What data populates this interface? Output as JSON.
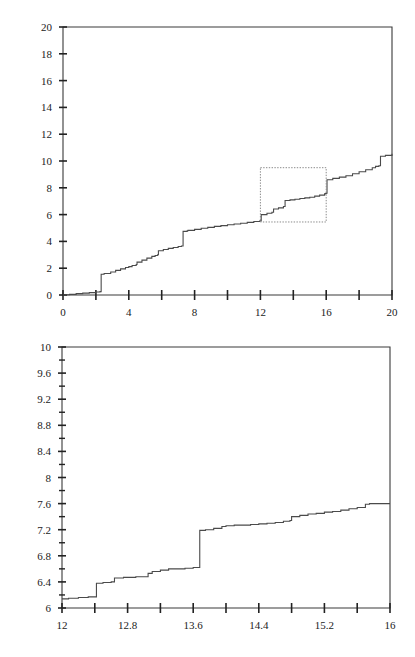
{
  "figure": {
    "title": "",
    "background": "#ffffff",
    "line_color": "#4a4a4a",
    "axis_color": "#3a3a3a",
    "zoom_box_color": "#8a8a8a"
  },
  "chart_data": [
    {
      "type": "line",
      "name": "overview-step-plot",
      "title": "",
      "xlabel": "",
      "ylabel": "",
      "xlim": [
        0,
        20
      ],
      "ylim": [
        0,
        20
      ],
      "grid": false,
      "legend": null,
      "xticks": [
        0,
        2,
        4,
        6,
        8,
        10,
        12,
        14,
        16,
        18,
        20
      ],
      "xtick_labels": [
        "0",
        "",
        "4",
        "",
        "8",
        "",
        "12",
        "",
        "16",
        "",
        "20"
      ],
      "yticks": [
        0,
        2,
        4,
        6,
        8,
        10,
        12,
        14,
        16,
        18,
        20
      ],
      "ytick_labels": [
        "0",
        "2",
        "4",
        "6",
        "8",
        "10",
        "12",
        "14",
        "16",
        "18",
        "20"
      ],
      "annotations": [
        {
          "kind": "dotted-rectangle",
          "x0": 12.0,
          "x1": 16.0,
          "y0": 5.45,
          "y1": 9.5,
          "note": "zoom region shown in lower panel"
        }
      ],
      "x": [
        0.0,
        0.15,
        0.4,
        0.8,
        1.2,
        1.6,
        2.0,
        2.25,
        2.3,
        2.32,
        2.5,
        2.9,
        3.2,
        3.5,
        3.8,
        4.0,
        4.2,
        4.45,
        4.5,
        4.8,
        5.1,
        5.4,
        5.6,
        5.75,
        5.8,
        6.1,
        6.4,
        6.7,
        7.0,
        7.2,
        7.25,
        7.3,
        7.55,
        7.6,
        8.0,
        8.4,
        8.8,
        9.2,
        9.6,
        10.0,
        10.4,
        10.8,
        11.2,
        11.6,
        11.95,
        12.0,
        12.05,
        12.4,
        12.7,
        12.75,
        12.8,
        13.1,
        13.4,
        13.45,
        13.5,
        13.8,
        14.1,
        14.4,
        14.7,
        15.0,
        15.3,
        15.6,
        15.9,
        15.95,
        16.0,
        16.05,
        16.4,
        16.8,
        17.2,
        17.6,
        18.0,
        18.4,
        18.8,
        19.0,
        19.2,
        19.25,
        19.3,
        19.6,
        20.0
      ],
      "y": [
        0.0,
        0.02,
        0.05,
        0.1,
        0.14,
        0.18,
        0.22,
        0.25,
        0.25,
        1.55,
        1.6,
        1.72,
        1.84,
        1.95,
        2.05,
        2.12,
        2.2,
        2.28,
        2.45,
        2.6,
        2.75,
        2.88,
        2.95,
        3.0,
        3.3,
        3.4,
        3.48,
        3.55,
        3.62,
        3.66,
        3.66,
        4.75,
        4.8,
        4.82,
        4.9,
        4.98,
        5.05,
        5.12,
        5.18,
        5.24,
        5.3,
        5.36,
        5.42,
        5.48,
        5.52,
        5.53,
        6.0,
        6.1,
        6.18,
        6.18,
        6.42,
        6.5,
        6.6,
        6.6,
        7.05,
        7.1,
        7.15,
        7.2,
        7.25,
        7.3,
        7.38,
        7.45,
        7.55,
        7.58,
        7.6,
        8.6,
        8.7,
        8.8,
        8.9,
        9.05,
        9.2,
        9.35,
        9.5,
        9.6,
        9.65,
        9.65,
        10.35,
        10.42,
        10.55
      ]
    },
    {
      "type": "line",
      "name": "detail-step-plot",
      "title": "",
      "xlabel": "",
      "ylabel": "",
      "xlim": [
        12,
        16
      ],
      "ylim": [
        6,
        10
      ],
      "grid": false,
      "legend": null,
      "xticks": [
        12,
        12.4,
        12.8,
        13.2,
        13.6,
        14.0,
        14.4,
        14.8,
        15.2,
        15.6,
        16
      ],
      "xtick_labels": [
        "12",
        "",
        "12.8",
        "",
        "13.6",
        "",
        "14.4",
        "",
        "15.2",
        "",
        "16"
      ],
      "yticks": [
        6,
        6.2,
        6.4,
        6.6,
        6.8,
        7.0,
        7.2,
        7.4,
        7.6,
        7.8,
        8.0,
        8.2,
        8.4,
        8.6,
        8.8,
        9.0,
        9.2,
        9.4,
        9.6,
        9.8,
        10
      ],
      "ytick_labels": [
        "6",
        "",
        "6.4",
        "",
        "6.8",
        "",
        "7.2",
        "",
        "7.6",
        "",
        "8",
        "",
        "8.4",
        "",
        "8.8",
        "",
        "9.2",
        "",
        "9.6",
        "",
        "10"
      ],
      "annotations": [],
      "x": [
        12.0,
        12.08,
        12.2,
        12.32,
        12.4,
        12.42,
        12.5,
        12.6,
        12.62,
        12.64,
        12.75,
        12.9,
        13.0,
        13.05,
        13.1,
        13.2,
        13.3,
        13.35,
        13.38,
        13.5,
        13.6,
        13.65,
        13.68,
        13.75,
        13.85,
        13.95,
        14.0,
        14.1,
        14.2,
        14.3,
        14.4,
        14.5,
        14.6,
        14.7,
        14.78,
        14.8,
        14.9,
        15.0,
        15.1,
        15.2,
        15.3,
        15.4,
        15.5,
        15.6,
        15.7,
        15.75,
        15.8,
        15.9,
        16.0
      ],
      "y": [
        6.14,
        6.15,
        6.16,
        6.17,
        6.17,
        6.38,
        6.39,
        6.4,
        6.4,
        6.46,
        6.47,
        6.48,
        6.48,
        6.53,
        6.56,
        6.58,
        6.6,
        6.6,
        6.6,
        6.61,
        6.62,
        6.62,
        7.19,
        7.2,
        7.22,
        7.25,
        7.26,
        7.27,
        7.27,
        7.28,
        7.29,
        7.3,
        7.31,
        7.33,
        7.34,
        7.4,
        7.42,
        7.44,
        7.45,
        7.47,
        7.48,
        7.5,
        7.52,
        7.54,
        7.59,
        7.6,
        7.6,
        7.6,
        7.6
      ]
    }
  ]
}
